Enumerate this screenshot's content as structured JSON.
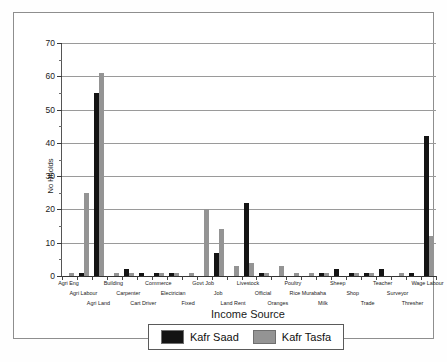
{
  "chart_data": {
    "type": "bar",
    "title": "",
    "xlabel": "Income Source",
    "ylabel": "No Hholds",
    "ylim": [
      0,
      70
    ],
    "ytick_step": 10,
    "yticks": [
      0,
      10,
      20,
      30,
      40,
      50,
      60,
      70
    ],
    "grid": true,
    "legend_position": "bottom",
    "colors": {
      "kafr_saad": "#141414",
      "kafr_tasfa": "#949494"
    },
    "categories": [
      "Agri Eng",
      "Agri Labour",
      "Agri Land",
      "Building",
      "Carpenter",
      "Cart Driver",
      "Commerce",
      "Electrician",
      "Fixed",
      "Govt Job",
      "Job",
      "Land Rent",
      "Livestock",
      "Official",
      "Oranges",
      "Poultry",
      "Rice Murabaha",
      "Milk",
      "Sheep",
      "Shop",
      "Trade",
      "Teacher",
      "Surveyor",
      "Thresher",
      "Wage Labour"
    ],
    "series": [
      {
        "name": "Kafr Saad",
        "color": "#141414",
        "values": [
          0,
          1,
          55,
          0,
          2,
          1,
          1,
          1,
          0,
          0,
          7,
          0,
          22,
          1,
          0,
          0,
          0,
          1,
          2,
          1,
          1,
          2,
          0,
          1,
          42
        ]
      },
      {
        "name": "Kafr Tasfa",
        "color": "#949494",
        "values": [
          1,
          25,
          61,
          1,
          1,
          0,
          1,
          1,
          1,
          20,
          14,
          3,
          4,
          1,
          3,
          1,
          1,
          1,
          0,
          1,
          1,
          0,
          1,
          0,
          12
        ]
      }
    ]
  },
  "legend": {
    "entries": [
      {
        "label": "Kafr Saad",
        "swatch": "kafr-saad-swatch"
      },
      {
        "label": "Kafr Tasfa",
        "swatch": "kafr-tasfa-swatch"
      }
    ]
  },
  "bottom_caption": ""
}
